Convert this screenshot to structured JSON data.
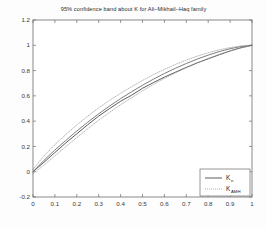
{
  "chart_data": {
    "type": "line",
    "title": "95% confidence band about K for Ali–Mikhail–Haq family",
    "xlabel": "",
    "ylabel": "",
    "xlim": [
      0,
      1
    ],
    "ylim": [
      -0.2,
      1.2
    ],
    "xticks": [
      "0",
      "0.1",
      "0.2",
      "0.3",
      "0.4",
      "0.5",
      "0.6",
      "0.7",
      "0.8",
      "0.9",
      "1"
    ],
    "xtick_values": [
      0,
      0.1,
      0.2,
      0.3,
      0.4,
      0.5,
      0.6,
      0.7,
      0.8,
      0.9,
      1
    ],
    "yticks": [
      "-0.2",
      "0",
      "0.2",
      "0.4",
      "0.6",
      "0.8",
      "1",
      "1.2"
    ],
    "ytick_values": [
      -0.2,
      0,
      0.2,
      0.4,
      0.6,
      0.8,
      1,
      1.2
    ],
    "grid": false,
    "legend_position": "lower right",
    "series": [
      {
        "name": "K_n",
        "legend_label": "K",
        "legend_subscript": "n",
        "style": "solid",
        "color": "#4a4a4a",
        "x": [
          0,
          0.05,
          0.1,
          0.15,
          0.2,
          0.25,
          0.3,
          0.35,
          0.4,
          0.45,
          0.5,
          0.55,
          0.6,
          0.65,
          0.7,
          0.75,
          0.8,
          0.85,
          0.9,
          0.95,
          1
        ],
        "values": [
          0,
          0.075,
          0.152,
          0.228,
          0.3,
          0.372,
          0.44,
          0.5,
          0.557,
          0.605,
          0.66,
          0.705,
          0.748,
          0.787,
          0.825,
          0.861,
          0.893,
          0.925,
          0.955,
          0.981,
          1
        ]
      },
      {
        "name": "K_AMH",
        "legend_label": "K",
        "legend_subscript": "AMH",
        "style": "solid",
        "color": "#6e6e6e",
        "x": [
          0,
          0.05,
          0.1,
          0.15,
          0.2,
          0.25,
          0.3,
          0.35,
          0.4,
          0.45,
          0.5,
          0.55,
          0.6,
          0.65,
          0.7,
          0.75,
          0.8,
          0.85,
          0.9,
          0.95,
          1
        ],
        "values": [
          0,
          0.09,
          0.172,
          0.248,
          0.322,
          0.392,
          0.458,
          0.52,
          0.578,
          0.632,
          0.684,
          0.732,
          0.777,
          0.818,
          0.856,
          0.891,
          0.922,
          0.95,
          0.973,
          0.99,
          1
        ]
      },
      {
        "name": "upper-confidence-band",
        "legend_label": "",
        "legend_subscript": "",
        "style": "dotted",
        "color": "#9a9a9a",
        "x": [
          0,
          0.05,
          0.1,
          0.15,
          0.2,
          0.25,
          0.3,
          0.35,
          0.4,
          0.45,
          0.5,
          0.55,
          0.6,
          0.65,
          0.7,
          0.75,
          0.8,
          0.85,
          0.9,
          0.95,
          1
        ],
        "values": [
          0.018,
          0.125,
          0.215,
          0.295,
          0.37,
          0.44,
          0.505,
          0.565,
          0.62,
          0.672,
          0.722,
          0.768,
          0.81,
          0.848,
          0.883,
          0.914,
          0.941,
          0.964,
          0.982,
          0.995,
          1.002
        ]
      },
      {
        "name": "lower-confidence-band",
        "legend_label": "",
        "legend_subscript": "",
        "style": "dotted",
        "color": "#9a9a9a",
        "x": [
          0,
          0.05,
          0.1,
          0.15,
          0.2,
          0.25,
          0.3,
          0.35,
          0.4,
          0.45,
          0.5,
          0.55,
          0.6,
          0.65,
          0.7,
          0.75,
          0.8,
          0.85,
          0.9,
          0.95,
          1
        ],
        "values": [
          -0.015,
          0.052,
          0.125,
          0.198,
          0.27,
          0.34,
          0.408,
          0.47,
          0.53,
          0.585,
          0.64,
          0.69,
          0.738,
          0.782,
          0.822,
          0.861,
          0.896,
          0.928,
          0.956,
          0.979,
          0.998
        ]
      }
    ]
  }
}
